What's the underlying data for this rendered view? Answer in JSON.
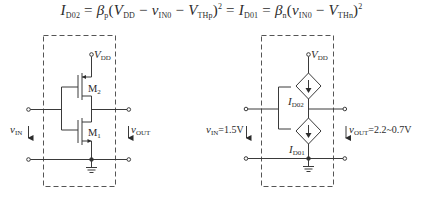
{
  "equation": {
    "lhs_current": "I",
    "lhs_current_sub": "D02",
    "eq1": " = ",
    "beta_p": "β",
    "beta_p_sub": "p",
    "open1": "(",
    "vdd": "V",
    "vdd_sub": "DD",
    "minus1": " − ",
    "vin0": "v",
    "vin0_sub": "IN0",
    "minus2": " − ",
    "vthp": "V",
    "vthp_sub": "THp",
    "close1": ")",
    "sq1": "2",
    "eq2": " = ",
    "rhs_current": "I",
    "rhs_current_sub": "D01",
    "eq3": " = ",
    "beta_n": "β",
    "beta_n_sub": "n",
    "open2": "(",
    "vin0b": "v",
    "vin0b_sub": "IN0",
    "minus3": " − ",
    "vthn": "V",
    "vthn_sub": "THn",
    "close2": ")",
    "sq2": "2"
  },
  "left_circuit": {
    "vdd_label": "V",
    "vdd_sub": "DD",
    "m2_label": "M",
    "m2_sub": "2",
    "m1_label": "M",
    "m1_sub": "1",
    "vin_label": "v",
    "vin_sub": "IN",
    "vout_label": "v",
    "vout_sub": "OUT"
  },
  "right_circuit": {
    "vdd_label": "V",
    "vdd_sub": "DD",
    "id02_label": "I",
    "id02_sub": "D02",
    "id01_label": "I",
    "id01_sub": "D01",
    "vin_label": "v",
    "vin_sub": "IN",
    "vin_value": "=1.5V",
    "vout_label": "v",
    "vout_sub": "OUT",
    "vout_value": "=2.2~0.7V"
  },
  "colors": {
    "line": "#3a3a3a",
    "dashed_box": "#555555",
    "background": "#ffffff"
  }
}
